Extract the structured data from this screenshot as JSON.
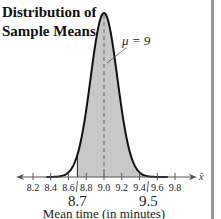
{
  "chart_data": {
    "type": "area",
    "title": "Distribution of Sample Means",
    "title_lines": [
      "Distribution of",
      "Sample Means"
    ],
    "distribution": "normal",
    "mean": 9.0,
    "std_error": 0.15,
    "mean_label": "μ = 9",
    "shaded_interval": [
      8.7,
      9.5
    ],
    "shaded_labels": [
      "8.7",
      "9.5"
    ],
    "xlabel": "Mean time (in minutes)",
    "axis_symbol": "x̄",
    "xlim": [
      8.1,
      9.9
    ],
    "x_ticks": [
      8.2,
      8.4,
      8.6,
      8.8,
      9.0,
      9.2,
      9.4,
      9.6,
      9.8
    ],
    "x_tick_labels": [
      "8.2",
      "8.4",
      "8.6",
      "8.8",
      "9.0",
      "9.2",
      "9.4",
      "9.6",
      "9.8"
    ],
    "grid": false,
    "colors": {
      "shade": "#c8c8c8",
      "curve": "#111111",
      "axis": "#555555",
      "mean_line": "#666666"
    }
  }
}
